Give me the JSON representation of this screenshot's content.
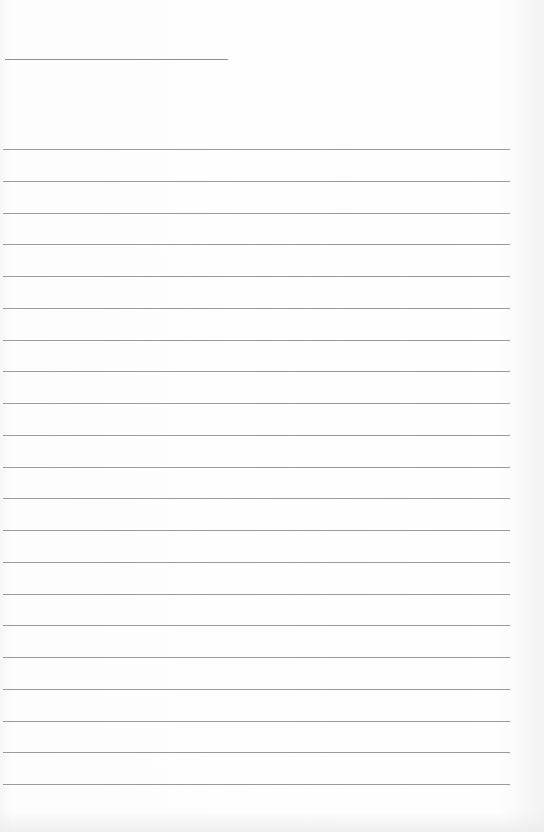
{
  "document": {
    "type": "lined-paper",
    "background_color": "#fcfcfc",
    "line_color": "#9a9a9a",
    "header_line": {
      "top": 59,
      "left": 5,
      "width": 223
    },
    "ruled_lines": {
      "count": 21,
      "first_top": 149,
      "spacing": 31.75,
      "left": 3,
      "width": 507
    }
  }
}
